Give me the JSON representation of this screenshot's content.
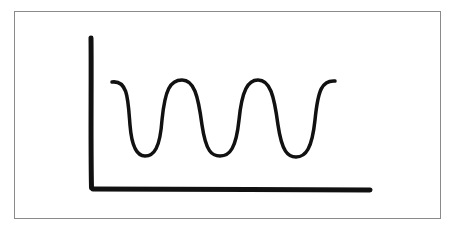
{
  "diagram": {
    "stroke_color": "#111111",
    "frame_color": "#8a8a8a",
    "wave": {
      "shape": "sinusoid",
      "peaks": 4,
      "troughs": 3
    }
  }
}
